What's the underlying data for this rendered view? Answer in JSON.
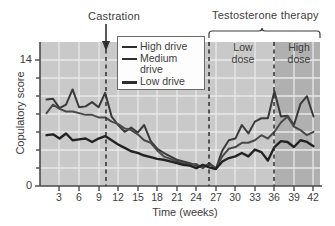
{
  "annotations": {
    "castration": "Castration",
    "testosterone_therapy": "Testosterone therapy",
    "low_dose": "Low\ndose",
    "low_dose_line1": "Low",
    "low_dose_line2": "dose",
    "high_dose_line1": "High",
    "high_dose_line2": "dose"
  },
  "legend": {
    "position": "inside-top-center",
    "items": [
      {
        "label": "High drive",
        "color": "#3a3a3a",
        "width": 2
      },
      {
        "label": "Medium",
        "label2": "drive",
        "color": "#4a4a4a",
        "width": 2
      },
      {
        "label": "Low drive",
        "color": "#222222",
        "width": 3
      }
    ]
  },
  "colors": {
    "plot_background": "#c9c9c9",
    "plot_background_dark": "#b0b0b0",
    "gridline": "#e8e8e8",
    "axis": "#4a4a4a",
    "text": "#3d3d3d",
    "high_drive": "#3a3a3a",
    "medium_drive": "#4a4a4a",
    "low_drive": "#222222"
  },
  "chart_data": {
    "type": "line",
    "title": "",
    "xlabel": "Time (weeks)",
    "ylabel": "Copulatory score",
    "xlim": [
      0,
      43
    ],
    "ylim": [
      0,
      17
    ],
    "xticks": [
      3,
      6,
      9,
      12,
      15,
      18,
      21,
      24,
      27,
      30,
      33,
      36,
      39,
      42
    ],
    "xtick_labels": [
      "3",
      "6",
      "9",
      "12",
      "15",
      "18",
      "21",
      "24",
      "27",
      "30",
      "33",
      "36",
      "39",
      "42"
    ],
    "yticks": [
      0,
      14
    ],
    "ytick_labels": [
      "0",
      "14"
    ],
    "grid": true,
    "legend_entries": [
      "High drive",
      "Medium drive",
      "Low drive"
    ],
    "markers": [
      {
        "label": "Castration",
        "x": 10,
        "style": "dashed-vline-with-arrow"
      },
      {
        "label": "Testosterone therapy start",
        "x": 26.5,
        "style": "dashed-vline"
      },
      {
        "label": "High dose start",
        "x": 36,
        "style": "dashed-vline"
      }
    ],
    "shaded_regions": [
      {
        "label": "High dose",
        "x_from": 36,
        "x_to": 43,
        "shade": "dark"
      }
    ],
    "x": [
      1,
      2,
      3,
      4,
      5,
      6,
      7,
      8,
      9,
      10,
      11,
      12,
      13,
      14,
      15,
      16,
      17,
      18,
      19,
      20,
      21,
      22,
      23,
      24,
      25,
      26,
      27,
      28,
      29,
      30,
      31,
      32,
      33,
      34,
      35,
      36,
      37,
      38,
      39,
      40,
      41,
      42
    ],
    "series": [
      {
        "name": "High drive",
        "color": "#3a3a3a",
        "values": [
          10.2,
          10.3,
          9.2,
          9.6,
          11.4,
          9.3,
          9.4,
          9.9,
          9.3,
          11.0,
          8.2,
          7.2,
          6.4,
          6.9,
          6.3,
          7.2,
          5.3,
          4.4,
          3.9,
          3.5,
          3.1,
          2.9,
          2.7,
          2.4,
          2.2,
          2.6,
          2.0,
          4.2,
          5.4,
          5.6,
          7.2,
          6.2,
          7.6,
          8.0,
          8.0,
          11.2,
          8.2,
          8.3,
          7.2,
          9.7,
          10.6,
          8.2
        ]
      },
      {
        "name": "Medium drive",
        "color": "#4a4a4a",
        "values": [
          8.6,
          9.6,
          9.1,
          8.8,
          8.8,
          8.6,
          8.4,
          8.4,
          8.1,
          8.1,
          7.6,
          7.3,
          6.8,
          6.6,
          6.1,
          5.4,
          5.1,
          4.2,
          3.5,
          3.2,
          2.9,
          2.7,
          2.5,
          2.6,
          2.1,
          2.7,
          2.1,
          3.5,
          4.4,
          4.6,
          5.1,
          5.1,
          5.4,
          6.0,
          5.6,
          6.4,
          7.5,
          8.2,
          7.0,
          6.6,
          6.0,
          6.4
        ]
      },
      {
        "name": "Low drive",
        "color": "#222222",
        "values": [
          6.0,
          6.1,
          5.6,
          6.2,
          5.4,
          5.5,
          5.6,
          5.2,
          5.6,
          5.9,
          5.4,
          4.9,
          4.5,
          4.1,
          3.9,
          3.6,
          3.4,
          3.2,
          3.1,
          2.9,
          2.7,
          2.5,
          2.4,
          2.1,
          2.5,
          2.2,
          2.0,
          2.9,
          3.3,
          3.5,
          3.9,
          3.5,
          4.3,
          4.0,
          3.0,
          4.6,
          5.3,
          5.2,
          4.6,
          5.4,
          5.2,
          4.7
        ]
      }
    ]
  }
}
